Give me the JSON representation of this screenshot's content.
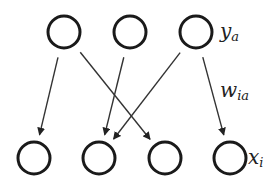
{
  "labels": {
    "top_layer": "y",
    "top_layer_sub": "a",
    "weight": "w",
    "weight_sub": "ia",
    "bottom_layer": "x",
    "bottom_layer_sub": "i"
  },
  "top_nodes": 3,
  "bottom_nodes": 4,
  "edges": [
    {
      "from": 0,
      "to": 0
    },
    {
      "from": 0,
      "to": 2
    },
    {
      "from": 1,
      "to": 1
    },
    {
      "from": 2,
      "to": 1
    },
    {
      "from": 2,
      "to": 3
    }
  ]
}
